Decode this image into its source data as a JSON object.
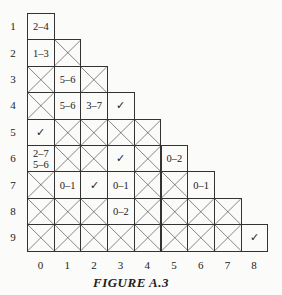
{
  "figure": {
    "caption": "FIGURE A.3",
    "row_labels": [
      "1",
      "2",
      "3",
      "4",
      "5",
      "6",
      "7",
      "8",
      "9"
    ],
    "col_labels": [
      "0",
      "1",
      "2",
      "3",
      "4",
      "5",
      "6",
      "7",
      "8"
    ],
    "rows": [
      [
        {
          "t": "2–4"
        }
      ],
      [
        {
          "t": "1–3"
        },
        {
          "x": true
        }
      ],
      [
        {
          "x": true
        },
        {
          "t": "5–6"
        },
        {
          "x": true
        }
      ],
      [
        {
          "x": true
        },
        {
          "t": "5–6"
        },
        {
          "t": "3–7"
        },
        {
          "t": "✓"
        }
      ],
      [
        {
          "t": "✓"
        },
        {
          "x": true
        },
        {
          "x": true
        },
        {
          "x": true
        },
        {
          "x": true
        }
      ],
      [
        {
          "t": "2–7",
          "t2": "5–6"
        },
        {
          "x": true
        },
        {
          "x": true
        },
        {
          "t": "✓"
        },
        {
          "x": true
        },
        {
          "t": "0–2"
        }
      ],
      [
        {
          "x": true
        },
        {
          "t": "0–1"
        },
        {
          "t": "✓"
        },
        {
          "t": "0–1"
        },
        {
          "x": true
        },
        {
          "x": true
        },
        {
          "t": "0–1"
        }
      ],
      [
        {
          "x": true
        },
        {
          "x": true
        },
        {
          "x": true
        },
        {
          "t": "0–2"
        },
        {
          "x": true
        },
        {
          "x": true
        },
        {
          "x": true
        },
        {
          "x": true
        }
      ],
      [
        {
          "x": true
        },
        {
          "x": true
        },
        {
          "x": true
        },
        {
          "x": true
        },
        {
          "x": true
        },
        {
          "x": true
        },
        {
          "x": true
        },
        {
          "x": true
        },
        {
          "t": "✓"
        }
      ]
    ]
  }
}
